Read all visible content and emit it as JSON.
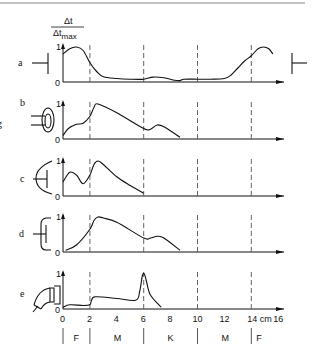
{
  "figure": {
    "ylabel_num": "Δt",
    "ylabel_den": "Δt",
    "ylabel_den_sub": "max",
    "xunit": "cm",
    "panel_letters": [
      "a",
      "b",
      "c",
      "d",
      "e"
    ],
    "edge_glyph": "g",
    "regions": [
      "F",
      "M",
      "K",
      "M",
      "F"
    ]
  },
  "chart_data": {
    "type": "line",
    "title": "",
    "xlabel": "cm",
    "ylabel": "Δt/Δt_max",
    "xlim": [
      0,
      16
    ],
    "ylim": [
      0,
      1
    ],
    "xticks": [
      0,
      2,
      4,
      6,
      8,
      10,
      12,
      14,
      16
    ],
    "xtick_labels": [
      "0",
      "2",
      "4",
      "6",
      "8",
      "10",
      "12",
      "14 cm",
      "16"
    ],
    "yticks": [
      0,
      1
    ],
    "dashed_guides_x": [
      2,
      6,
      10,
      14
    ],
    "region_labels": [
      {
        "label": "F",
        "from": 0,
        "to": 2
      },
      {
        "label": "M",
        "from": 2,
        "to": 6
      },
      {
        "label": "K",
        "from": 6,
        "to": 10
      },
      {
        "label": "M",
        "from": 10,
        "to": 14
      },
      {
        "label": "F",
        "from": 14,
        "to": 16
      }
    ],
    "grid": false,
    "series": [
      {
        "name": "a",
        "x": [
          0,
          0.5,
          1.0,
          1.5,
          2.0,
          2.5,
          3.0,
          4.0,
          5.0,
          6.0,
          6.7,
          7.5,
          8.3,
          8.7,
          9.0,
          10.0,
          11.0,
          12.0,
          12.5,
          13.0,
          13.5,
          14.0,
          14.5,
          14.9,
          15.3,
          15.6
        ],
        "y": [
          0.8,
          0.95,
          1.0,
          0.9,
          0.55,
          0.3,
          0.15,
          0.1,
          0.08,
          0.08,
          0.14,
          0.12,
          0.05,
          0.04,
          0.08,
          0.08,
          0.08,
          0.1,
          0.2,
          0.4,
          0.6,
          0.75,
          0.95,
          1.0,
          0.95,
          0.8
        ]
      },
      {
        "name": "b",
        "x": [
          0,
          0.4,
          1.0,
          1.5,
          2.0,
          2.3,
          2.6,
          4.0,
          6.0,
          6.5,
          7.0,
          7.5,
          8.7
        ],
        "y": [
          0.1,
          0.3,
          0.42,
          0.45,
          0.65,
          0.9,
          1.0,
          0.75,
          0.3,
          0.28,
          0.4,
          0.35,
          0.05
        ]
      },
      {
        "name": "c",
        "x": [
          0,
          0.5,
          1.0,
          1.5,
          2.0,
          2.3,
          2.6,
          3.0,
          4.0,
          5.0,
          6.0
        ],
        "y": [
          0.4,
          0.68,
          0.6,
          0.35,
          0.6,
          0.9,
          1.0,
          0.9,
          0.55,
          0.3,
          0.08
        ]
      },
      {
        "name": "d",
        "x": [
          0.2,
          1.0,
          2.0,
          2.3,
          2.6,
          3.0,
          4.0,
          6.0,
          6.5,
          7.0,
          7.5,
          8.7
        ],
        "y": [
          0.05,
          0.2,
          0.65,
          0.9,
          1.0,
          0.97,
          0.85,
          0.4,
          0.4,
          0.45,
          0.4,
          0.05
        ]
      },
      {
        "name": "e",
        "x": [
          0,
          0.5,
          1.5,
          2.0,
          2.1,
          2.4,
          4.0,
          5.4,
          5.7,
          5.9,
          6.05,
          6.2,
          6.5,
          7.3
        ],
        "y": [
          0.05,
          0.12,
          0.1,
          0.12,
          0.22,
          0.35,
          0.3,
          0.25,
          0.5,
          0.95,
          1.0,
          0.8,
          0.4,
          0.05
        ]
      }
    ]
  }
}
